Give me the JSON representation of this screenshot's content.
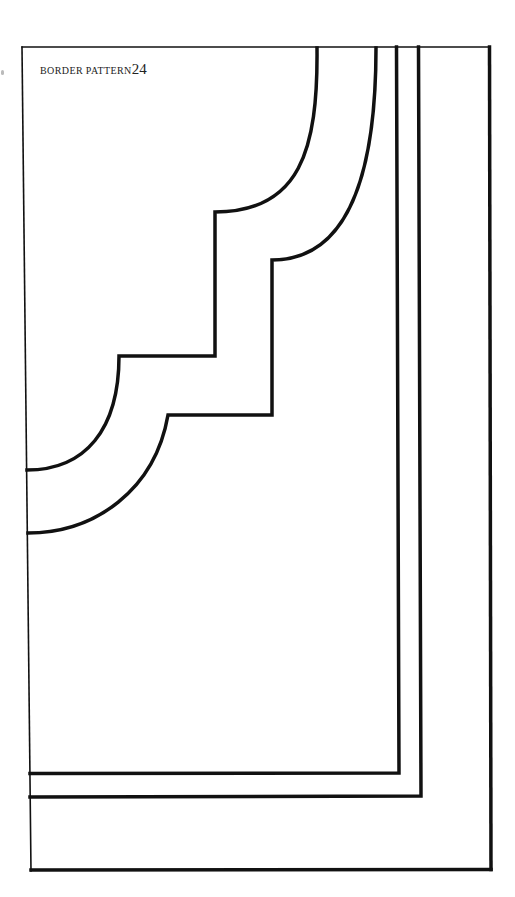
{
  "page": {
    "title": "BORDER PATTERN",
    "number": "24",
    "background": "#ffffff",
    "ink": "#111111"
  },
  "pattern": {
    "name": "border-pattern-24",
    "description": "Corner border pattern: two stepped scalloped curves and two nested rectangular frame lines inside an outer frame"
  }
}
